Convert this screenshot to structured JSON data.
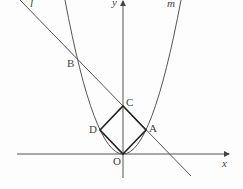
{
  "diagram": {
    "axes": {
      "x_label": "x",
      "y_label": "y",
      "origin_label": "O"
    },
    "curves": {
      "parabola_label": "m",
      "line_label": "l"
    },
    "points": {
      "A": "A",
      "B": "B",
      "C": "C",
      "D": "D"
    },
    "colors": {
      "stroke": "#444444",
      "square": "#222222"
    }
  }
}
